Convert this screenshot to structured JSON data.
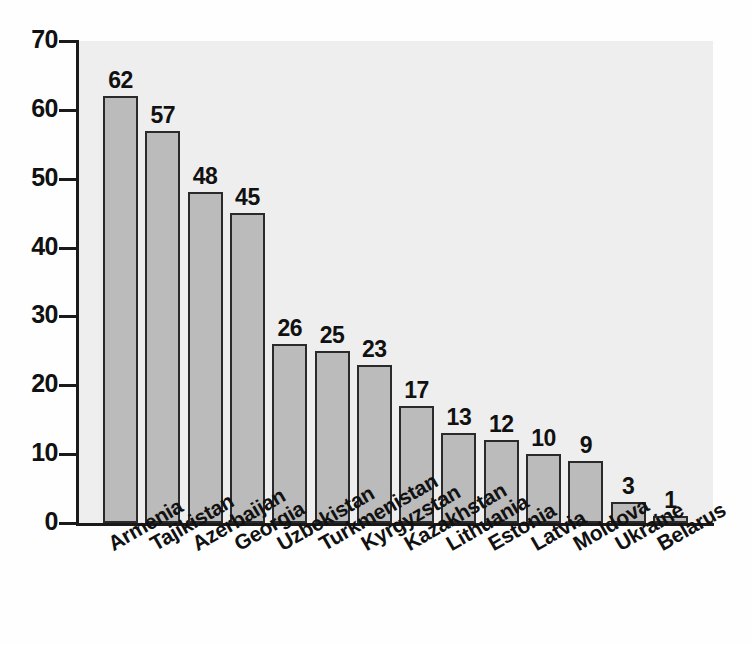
{
  "chart_data": {
    "type": "bar",
    "title": "",
    "subtitle": "",
    "xlabel": "",
    "ylabel": "",
    "ylim": [
      0,
      70
    ],
    "yticks": [
      0,
      10,
      20,
      30,
      40,
      50,
      60,
      70
    ],
    "grid": false,
    "legend": "none",
    "bar_color": "#bbbbbb",
    "bar_edge_color": "#2a2a2a",
    "plot_background": "#eeeeee",
    "categories": [
      "Armenia",
      "Tajikistan",
      "Azerbaijan",
      "Georgia",
      "Uzbekistan",
      "Turkmenistan",
      "Kyrgyzstan",
      "Kazakhstan",
      "Lithuania",
      "Estonia",
      "Latvia",
      "Moldova",
      "Ukraine",
      "Belarus"
    ],
    "values": [
      62,
      57,
      48,
      45,
      26,
      25,
      23,
      17,
      13,
      12,
      10,
      9,
      3,
      1
    ],
    "data_labels": [
      "62",
      "57",
      "48",
      "45",
      "26",
      "25",
      "23",
      "17",
      "13",
      "12",
      "10",
      "9",
      "3",
      "1"
    ],
    "tick_labels": [
      "0",
      "10",
      "20",
      "30",
      "40",
      "50",
      "60",
      "70"
    ]
  }
}
